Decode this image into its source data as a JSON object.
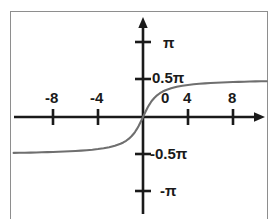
{
  "figure": {
    "title": "",
    "curve_color": "#6f6f6f",
    "axis_color": "#1a1a1a",
    "frame_color": "#8e8e8e",
    "background_color": "#ffffff"
  },
  "chart_data": {
    "type": "line",
    "title": "",
    "xlabel": "",
    "ylabel": "",
    "grid": false,
    "legend": "none",
    "xlim": [
      -11.5,
      11.0
    ],
    "ylim": [
      -3.6,
      3.7
    ],
    "x_ticks": [
      -8,
      -4,
      0,
      4,
      8
    ],
    "x_tick_labels": [
      "-8",
      "-4",
      "0",
      "4",
      "8"
    ],
    "y_ticks": [
      -3.14159,
      -1.5708,
      1.5708,
      3.14159
    ],
    "y_tick_labels": [
      "-π",
      "-0.5π",
      "0.5π",
      "π"
    ],
    "series": [
      {
        "name": "arctan(x)",
        "x": [
          -11.5,
          -11.0,
          -10.5,
          -10.0,
          -9.5,
          -9.0,
          -8.5,
          -8.0,
          -7.5,
          -7.0,
          -6.5,
          -6.0,
          -5.5,
          -5.0,
          -4.5,
          -4.0,
          -3.5,
          -3.0,
          -2.5,
          -2.0,
          -1.75,
          -1.5,
          -1.25,
          -1.0,
          -0.85,
          -0.7,
          -0.55,
          -0.4,
          -0.3,
          -0.2,
          -0.1,
          0.0,
          0.1,
          0.2,
          0.3,
          0.4,
          0.55,
          0.7,
          0.85,
          1.0,
          1.25,
          1.5,
          1.75,
          2.0,
          2.5,
          3.0,
          3.5,
          4.0,
          4.5,
          5.0,
          5.5,
          6.0,
          6.5,
          7.0,
          7.5,
          8.0,
          8.5,
          9.0,
          9.5,
          10.0,
          10.5,
          11.0
        ],
        "y": [
          -1.484,
          -1.48,
          -1.476,
          -1.471,
          -1.466,
          -1.46,
          -1.454,
          -1.446,
          -1.438,
          -1.429,
          -1.418,
          -1.406,
          -1.391,
          -1.373,
          -1.352,
          -1.326,
          -1.293,
          -1.249,
          -1.19,
          -1.107,
          -1.052,
          -0.983,
          -0.896,
          -0.785,
          -0.705,
          -0.611,
          -0.503,
          -0.381,
          -0.291,
          -0.197,
          -0.1,
          0.0,
          0.1,
          0.197,
          0.291,
          0.381,
          0.503,
          0.611,
          0.705,
          0.785,
          0.896,
          0.983,
          1.052,
          1.107,
          1.19,
          1.249,
          1.293,
          1.326,
          1.352,
          1.373,
          1.391,
          1.406,
          1.418,
          1.429,
          1.438,
          1.446,
          1.454,
          1.46,
          1.466,
          1.471,
          1.476,
          1.48
        ]
      }
    ],
    "asymptotes": [
      {
        "value": 1.5708,
        "label": "0.5π"
      },
      {
        "value": -1.5708,
        "label": "-0.5π"
      }
    ]
  },
  "x_axis_labels": [
    {
      "id": "x-label-neg8",
      "text": "-8"
    },
    {
      "id": "x-label-neg4",
      "text": "-4"
    },
    {
      "id": "x-label-zero",
      "text": "0"
    },
    {
      "id": "x-label-pos4",
      "text": "4"
    },
    {
      "id": "x-label-pos8",
      "text": "8"
    }
  ],
  "y_axis_labels": [
    {
      "id": "y-label-pi",
      "text": "π"
    },
    {
      "id": "y-label-half-pi",
      "text": "0.5π"
    },
    {
      "id": "y-label-neg-half-pi",
      "text": "-0.5π"
    },
    {
      "id": "y-label-neg-pi",
      "text": "-π"
    }
  ]
}
